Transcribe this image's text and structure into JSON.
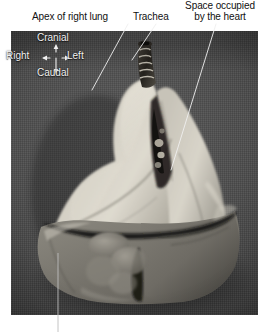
{
  "figure": {
    "kind": "anatomical-photograph",
    "colors": {
      "caption_text": "#111111",
      "overlay_text": "#f2f2f2",
      "leader_line": "#e8e8e8",
      "background_cloth": "#4a4a4a",
      "lung_tissue": "#c9c6bb",
      "lower_lobe_tissue": "#7d7a72",
      "trachea_dark": "#2a2722"
    }
  },
  "labels": {
    "apex": "Apex of right lung",
    "trachea": "Trachea",
    "heart_line1": "Space occupied",
    "heart_line2": "by the heart"
  },
  "orientation": {
    "cranial": "Cranial",
    "caudal": "Caudal",
    "right": "Right",
    "left": "Left"
  },
  "leaders": [
    {
      "name": "apex-leader",
      "from": [
        128,
        24
      ],
      "to": [
        92,
        90
      ]
    },
    {
      "name": "trachea-leader",
      "from": [
        156,
        24
      ],
      "to": [
        131,
        62
      ]
    },
    {
      "name": "heart-leader",
      "from": [
        216,
        24
      ],
      "to": [
        171,
        170
      ]
    },
    {
      "name": "bottom-leader",
      "from": [
        58,
        253
      ],
      "to": [
        58,
        332
      ]
    }
  ]
}
